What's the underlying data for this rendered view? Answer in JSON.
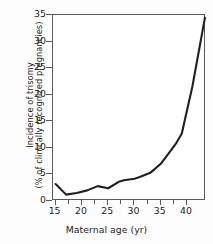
{
  "chart_data": {
    "type": "line",
    "title": "",
    "subtitle": "",
    "xlabel": "Maternal age (yr)",
    "ylabel_line1": "Incidence of trisomy",
    "ylabel_line2": "(% of clinically recognized pregnancies)",
    "xlim": [
      14.5,
      43.6
    ],
    "ylim": [
      0,
      35
    ],
    "grid": false,
    "legend": null,
    "xticks": [
      15,
      20,
      25,
      30,
      35,
      40
    ],
    "xtick_labels": [
      "15",
      "20",
      "25",
      "30",
      "35",
      "40"
    ],
    "yticks": [
      0,
      5,
      10,
      15,
      20,
      25,
      30,
      35
    ],
    "ytick_labels": [
      "0",
      "5",
      "10",
      "15",
      "20",
      "25",
      "30",
      "35"
    ],
    "series": [
      {
        "name": "Incidence of trisomy",
        "color": "#231f20",
        "x": [
          15,
          17,
          19,
          21,
          23,
          25,
          27,
          28,
          30,
          31,
          33,
          35,
          37,
          38,
          39,
          41,
          43.4
        ],
        "values": [
          3.2,
          1.2,
          1.5,
          2.0,
          2.8,
          2.4,
          3.6,
          3.9,
          4.2,
          4.5,
          5.3,
          7.0,
          9.6,
          11.0,
          12.7,
          21.5,
          34.5
        ]
      }
    ],
    "annotations": []
  },
  "axis": {
    "x_tick_color": "#58595b",
    "y_tick_color": "#58595b",
    "frame_color": "#58595b"
  }
}
